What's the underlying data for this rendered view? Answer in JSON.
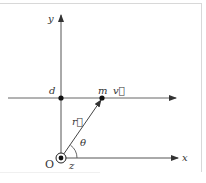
{
  "diagram": {
    "type": "physics-vector-diagram",
    "labels": {
      "y_axis": "y",
      "x_axis": "x",
      "origin": "O",
      "z_axis": "z",
      "point_d": "d",
      "point_m": "m",
      "velocity": "v⃗",
      "position": "r⃗",
      "angle": "θ"
    },
    "colors": {
      "line": "#444444",
      "frame": "#d8d8d8",
      "text": "#333333"
    },
    "elements": [
      {
        "name": "y-axis",
        "from": "O",
        "direction": "up"
      },
      {
        "name": "x-axis",
        "from": "O",
        "direction": "right"
      },
      {
        "name": "trajectory-line",
        "description": "horizontal line through d and m, parallel to x-axis"
      },
      {
        "name": "velocity-arrow",
        "at": "m",
        "direction": "right"
      },
      {
        "name": "position-vector",
        "from": "O",
        "to": "m"
      },
      {
        "name": "angle-arc",
        "between": [
          "x-axis",
          "position-vector"
        ]
      },
      {
        "name": "z-axis-out-of-page",
        "at": "O",
        "symbol": "dot-in-circle"
      }
    ]
  }
}
